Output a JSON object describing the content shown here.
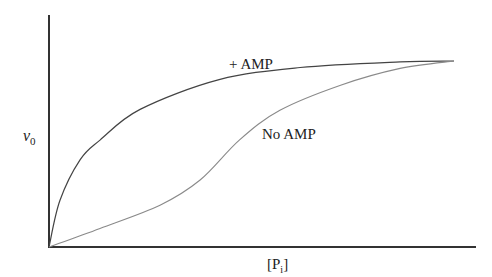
{
  "chart_data": {
    "type": "line",
    "title": "",
    "xlabel": "[P_i]",
    "xlabel_main": "[P",
    "xlabel_sub": "i",
    "xlabel_close": "]",
    "ylabel": "v_0",
    "ylabel_main": "v",
    "ylabel_sub": "0",
    "grid": false,
    "ticks": false,
    "xlim": [
      0,
      1.05
    ],
    "ylim": [
      0,
      1.25
    ],
    "series": [
      {
        "name": "+ AMP",
        "label": "+ AMP",
        "shape": "hyperbolic",
        "color": "#444444",
        "x": [
          0,
          0.027,
          0.077,
          0.126,
          0.225,
          0.42,
          0.62,
          0.867,
          1.0
        ],
        "y": [
          0,
          0.25,
          0.47,
          0.575,
          0.74,
          0.9,
          0.965,
          0.995,
          1.0
        ]
      },
      {
        "name": "No AMP",
        "label": "No AMP",
        "shape": "sigmoidal",
        "color": "#8a8a8a",
        "x": [
          0,
          0.126,
          0.274,
          0.373,
          0.47,
          0.57,
          0.72,
          0.867,
          1.0
        ],
        "y": [
          0,
          0.1,
          0.225,
          0.36,
          0.575,
          0.735,
          0.87,
          0.96,
          1.0
        ]
      }
    ],
    "annotations": [
      {
        "text": "+ AMP",
        "near_series": "+ AMP"
      },
      {
        "text": "No AMP",
        "near_series": "No AMP"
      }
    ]
  }
}
